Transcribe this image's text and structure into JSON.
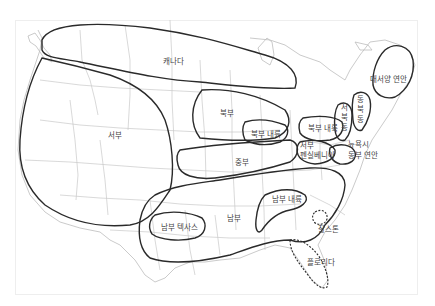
{
  "map": {
    "title": "",
    "regions": [
      {
        "id": "canada",
        "label": "캐나다"
      },
      {
        "id": "west",
        "label": "서부"
      },
      {
        "id": "north",
        "label": "북부"
      },
      {
        "id": "north-inland-west",
        "label": "북부 내륙"
      },
      {
        "id": "north-inland-east",
        "label": "북부 내륙"
      },
      {
        "id": "central",
        "label": "중부"
      },
      {
        "id": "western-pennsylvania",
        "label": "서부 펜실베니아"
      },
      {
        "id": "western-pennsylvania-line1",
        "label": "서부"
      },
      {
        "id": "western-pennsylvania-line2",
        "label": "펜실베니아"
      },
      {
        "id": "western-new-england",
        "label": "서북동"
      },
      {
        "id": "eastern-new-england",
        "label": "동북동"
      },
      {
        "id": "atlantic-coast",
        "label": "대서양 연안"
      },
      {
        "id": "new-york-city",
        "label": "뉴욕시"
      },
      {
        "id": "east-coast",
        "label": "동부 연안"
      },
      {
        "id": "south",
        "label": "남부"
      },
      {
        "id": "south-inland",
        "label": "남부 내륙"
      },
      {
        "id": "south-texas",
        "label": "남부 텍사스"
      },
      {
        "id": "charleston",
        "label": "찰스톤"
      },
      {
        "id": "florida",
        "label": "플로리다"
      }
    ],
    "colors": {
      "boundary": "#2a2a2a",
      "state_lines": "#c8c8c8",
      "label": "#444444",
      "background": "#ffffff"
    }
  }
}
